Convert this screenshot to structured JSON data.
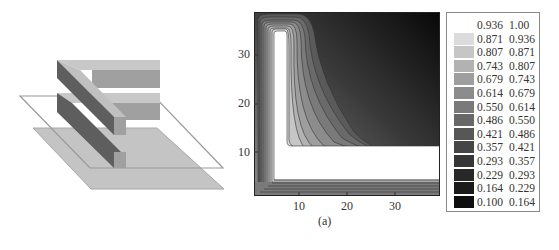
{
  "figure": {
    "caption": "(a)",
    "left_panel": {
      "description": "3D isometric view of an E-shaped/L-shaped block structure above a horizontal cut plane and base slab",
      "elements": [
        "top-bar",
        "middle-bar",
        "vertical-spine",
        "cut-plane-outline",
        "base-slab"
      ]
    }
  },
  "chart_data": {
    "type": "heatmap",
    "subtype": "filled-contour",
    "title": "",
    "xlabel": "",
    "ylabel": "",
    "xlim": [
      1,
      39
    ],
    "ylim": [
      1,
      39
    ],
    "xticks": [
      10,
      20,
      30
    ],
    "yticks": [
      10,
      20,
      30
    ],
    "grid": false,
    "legend_position": "right",
    "levels": [
      0.1,
      0.164,
      0.229,
      0.293,
      0.357,
      0.421,
      0.486,
      0.55,
      0.614,
      0.679,
      0.743,
      0.807,
      0.871,
      0.936,
      1.0
    ],
    "legend": [
      {
        "lo": "0.936",
        "hi": "1.00",
        "color": "#ffffff"
      },
      {
        "lo": "0.871",
        "hi": "0.936",
        "color": "#dcdcdc"
      },
      {
        "lo": "0.807",
        "hi": "0.871",
        "color": "#c6c6c6"
      },
      {
        "lo": "0.743",
        "hi": "0.807",
        "color": "#b2b2b2"
      },
      {
        "lo": "0.679",
        "hi": "0.743",
        "color": "#9e9e9e"
      },
      {
        "lo": "0.614",
        "hi": "0.679",
        "color": "#8c8c8c"
      },
      {
        "lo": "0.550",
        "hi": "0.614",
        "color": "#7a7a7a"
      },
      {
        "lo": "0.486",
        "hi": "0.550",
        "color": "#686868"
      },
      {
        "lo": "0.421",
        "hi": "0.486",
        "color": "#575757"
      },
      {
        "lo": "0.357",
        "hi": "0.421",
        "color": "#464646"
      },
      {
        "lo": "0.293",
        "hi": "0.357",
        "color": "#363636"
      },
      {
        "lo": "0.229",
        "hi": "0.293",
        "color": "#282828"
      },
      {
        "lo": "0.164",
        "hi": "0.229",
        "color": "#1b1b1b"
      },
      {
        "lo": "0.100",
        "hi": "0.164",
        "color": "#0e0e0e"
      }
    ],
    "region_of_max_value": {
      "shape": "L",
      "vertical_arm": {
        "x": [
          5,
          9
        ],
        "y": [
          5,
          35
        ]
      },
      "horizontal_arm": {
        "x": [
          5,
          39
        ],
        "y": [
          5,
          12
        ]
      }
    },
    "min_value_location": "top-right corner (x≈39, y≈39)"
  }
}
